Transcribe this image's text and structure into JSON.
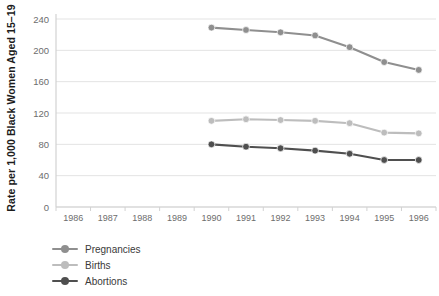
{
  "chart_data": {
    "type": "line",
    "title": "",
    "xlabel": "",
    "ylabel": "Rate per 1,000 Black Women Aged 15–19",
    "categories": [
      "1986",
      "1987",
      "1988",
      "1989",
      "1990",
      "1991",
      "1992",
      "1993",
      "1994",
      "1995",
      "1996"
    ],
    "x": [
      1986,
      1987,
      1988,
      1989,
      1990,
      1991,
      1992,
      1993,
      1994,
      1995,
      1996
    ],
    "ylim": [
      0,
      240
    ],
    "yticks": [
      0,
      40,
      80,
      120,
      160,
      200,
      240
    ],
    "ytick_labels": [
      "0",
      "40",
      "80",
      "120",
      "160",
      "200",
      "240"
    ],
    "grid": "horizontal",
    "legend_position": "bottom-left",
    "series": [
      {
        "name": "Pregnancies",
        "color": "#8f8f8f",
        "x": [
          1990,
          1991,
          1992,
          1993,
          1994,
          1995,
          1996
        ],
        "values": [
          229,
          226,
          223,
          219,
          204,
          185,
          175
        ]
      },
      {
        "name": "Births",
        "color": "#bdbdbd",
        "x": [
          1990,
          1991,
          1992,
          1993,
          1994,
          1995,
          1996
        ],
        "values": [
          110,
          112,
          111,
          110,
          107,
          95,
          94
        ]
      },
      {
        "name": "Abortions",
        "color": "#4f4f4f",
        "x": [
          1990,
          1991,
          1992,
          1993,
          1994,
          1995,
          1996
        ],
        "values": [
          80,
          77,
          75,
          72,
          68,
          60,
          60
        ]
      }
    ]
  },
  "legend": {
    "items": [
      {
        "label": "Pregnancies",
        "color": "#8f8f8f"
      },
      {
        "label": "Births",
        "color": "#bdbdbd"
      },
      {
        "label": "Abortions",
        "color": "#4f4f4f"
      }
    ]
  },
  "axis_colors": {
    "grid": "#e3e3e3",
    "axis": "#d2d2d2",
    "tick_text": "#6d6d6d",
    "title_text": "#1c1c1c"
  }
}
